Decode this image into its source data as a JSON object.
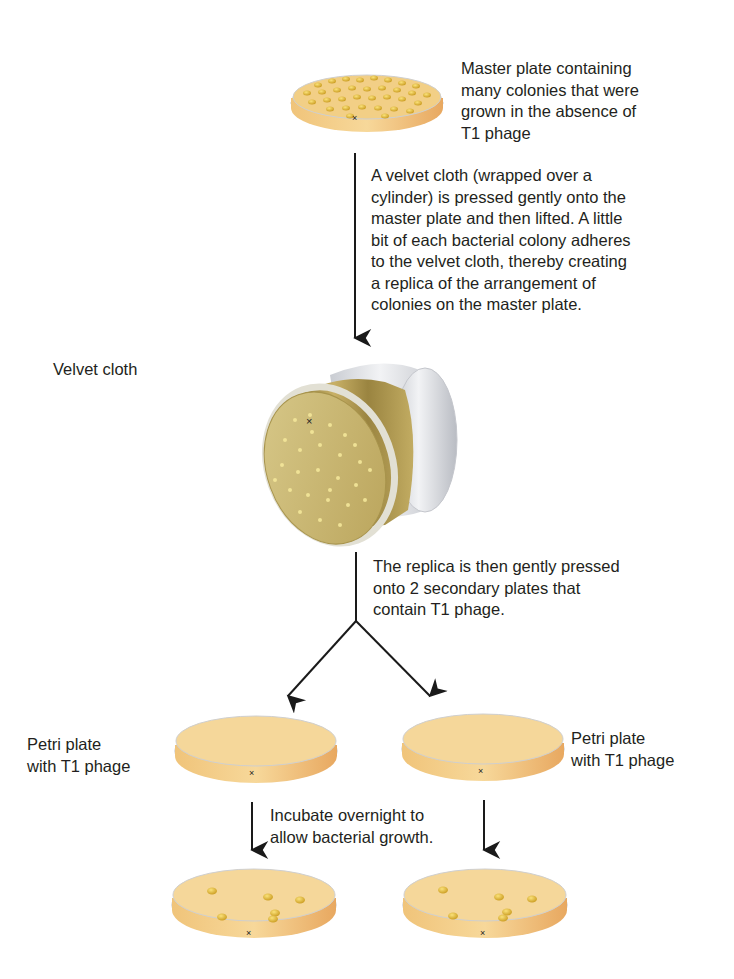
{
  "figure": {
    "type": "replica-plating-diagram",
    "steps": [
      {
        "id": "master-plate",
        "label": "Master plate containing\nmany colonies that were\ngrown in the absence of\nT1 phage"
      },
      {
        "id": "velvet-transfer",
        "label": "A velvet cloth (wrapped over a\ncylinder) is pressed gently onto the\nmaster plate and then lifted. A little\nbit of each bacterial colony adheres\nto the velvet cloth, thereby creating\na replica of the arrangement of\ncolonies on the master plate."
      },
      {
        "id": "velvet-cloth",
        "label": "Velvet cloth"
      },
      {
        "id": "replica-press",
        "label": "The replica is then gently pressed\nonto 2 secondary plates that\ncontain T1 phage."
      },
      {
        "id": "secondary-plate-left",
        "label": "Petri plate\nwith T1 phage"
      },
      {
        "id": "secondary-plate-right",
        "label": "Petri plate\nwith T1 phage"
      },
      {
        "id": "incubate",
        "label": "Incubate overnight to\nallow bacterial growth."
      }
    ],
    "result_plates": [
      {
        "id": "result-plate-left",
        "colony_count": 6
      },
      {
        "id": "result-plate-right",
        "colony_count": 6
      }
    ],
    "orientation_mark": "×"
  },
  "colors": {
    "agar": "#f3cf88",
    "agar_dark": "#e9b062",
    "colony": "#e3b52a",
    "velvet": "#c9b771",
    "cylinder": "#e4e6ea",
    "arrow": "#1a1a1a",
    "text": "#231f20"
  }
}
